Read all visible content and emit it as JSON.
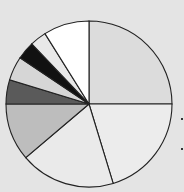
{
  "chart_data": {
    "type": "pie",
    "title": "",
    "start_angle_deg": 0,
    "direction": "clockwise",
    "labels": [
      "",
      "",
      "",
      "",
      "",
      "",
      "",
      "",
      ""
    ],
    "values": [
      25,
      20.3,
      18.5,
      11.2,
      4.7,
      4.7,
      3.5,
      3.2,
      8.9
    ],
    "colors": [
      "#dcdcdc",
      "#ececec",
      "#eaeaea",
      "#bdbdbd",
      "#5a5a5a",
      "#d6d6d6",
      "#111111",
      "#e8e8e8",
      "#ffffff"
    ],
    "legend": "none",
    "grid": false
  },
  "layout": {
    "center": [
      89,
      104
    ],
    "radius": 83,
    "background": "#e4e4e4",
    "stroke": "#222222"
  }
}
